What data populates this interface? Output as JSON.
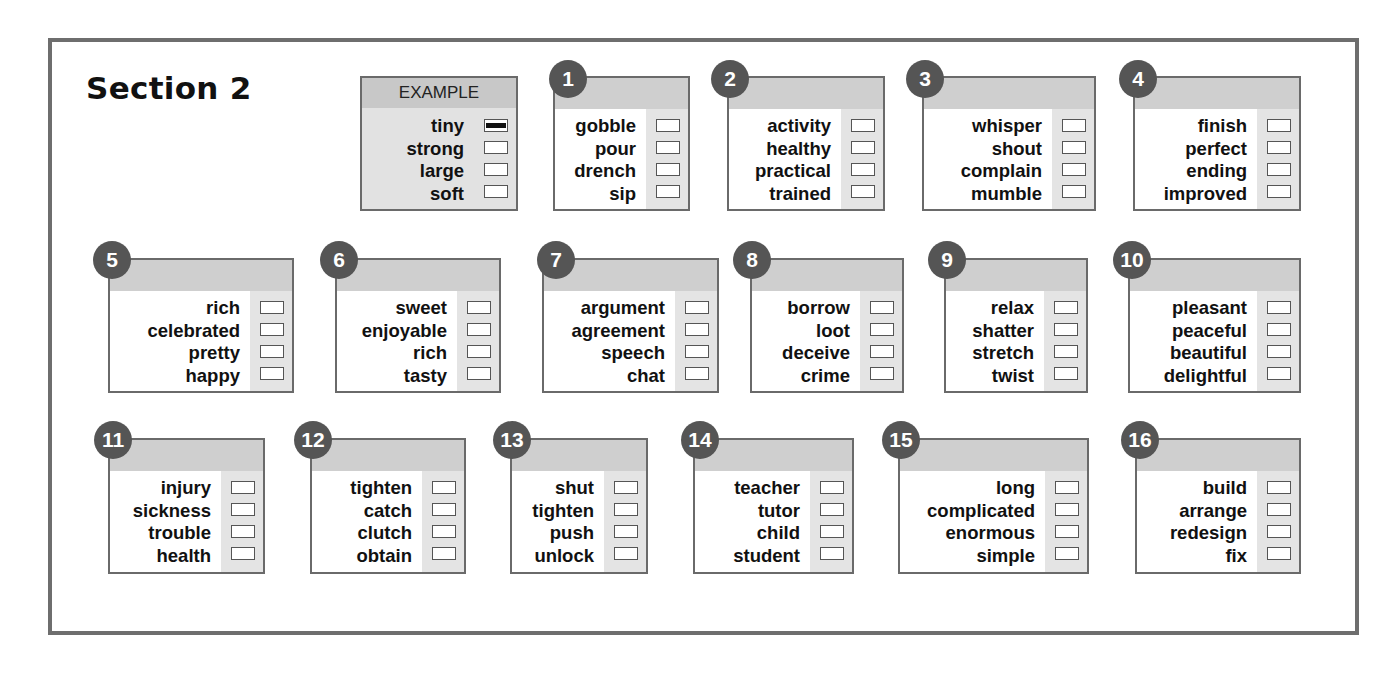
{
  "section_title": "Section 2",
  "colors": {
    "frame": "#6e6e6e",
    "badge": "#555555",
    "header": "#cfcfcf",
    "answer_column": "#e4e4e4"
  },
  "example": {
    "label": "EXAMPLE",
    "words": [
      "tiny",
      "strong",
      "large",
      "soft"
    ],
    "marked_index": 0
  },
  "questions": [
    {
      "number": "1",
      "words": [
        "gobble",
        "pour",
        "drench",
        "sip"
      ]
    },
    {
      "number": "2",
      "words": [
        "activity",
        "healthy",
        "practical",
        "trained"
      ]
    },
    {
      "number": "3",
      "words": [
        "whisper",
        "shout",
        "complain",
        "mumble"
      ]
    },
    {
      "number": "4",
      "words": [
        "finish",
        "perfect",
        "ending",
        "improved"
      ]
    },
    {
      "number": "5",
      "words": [
        "rich",
        "celebrated",
        "pretty",
        "happy"
      ]
    },
    {
      "number": "6",
      "words": [
        "sweet",
        "enjoyable",
        "rich",
        "tasty"
      ]
    },
    {
      "number": "7",
      "words": [
        "argument",
        "agreement",
        "speech",
        "chat"
      ]
    },
    {
      "number": "8",
      "words": [
        "borrow",
        "loot",
        "deceive",
        "crime"
      ]
    },
    {
      "number": "9",
      "words": [
        "relax",
        "shatter",
        "stretch",
        "twist"
      ]
    },
    {
      "number": "10",
      "words": [
        "pleasant",
        "peaceful",
        "beautiful",
        "delightful"
      ]
    },
    {
      "number": "11",
      "words": [
        "injury",
        "sickness",
        "trouble",
        "health"
      ]
    },
    {
      "number": "12",
      "words": [
        "tighten",
        "catch",
        "clutch",
        "obtain"
      ]
    },
    {
      "number": "13",
      "words": [
        "shut",
        "tighten",
        "push",
        "unlock"
      ]
    },
    {
      "number": "14",
      "words": [
        "teacher",
        "tutor",
        "child",
        "student"
      ]
    },
    {
      "number": "15",
      "words": [
        "long",
        "complicated",
        "enormous",
        "simple"
      ]
    },
    {
      "number": "16",
      "words": [
        "build",
        "arrange",
        "redesign",
        "fix"
      ]
    }
  ]
}
